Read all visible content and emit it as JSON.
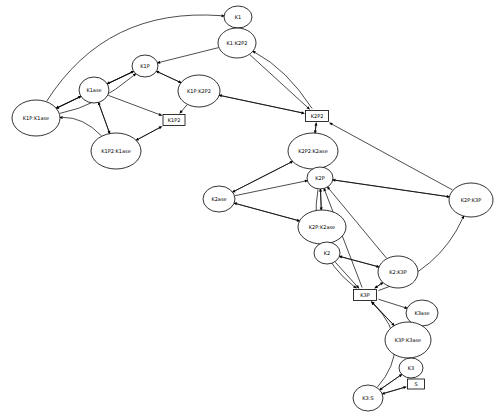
{
  "diagram": {
    "type": "directed-graph",
    "canvas": {
      "width": 500,
      "height": 420,
      "background": "#ffffff"
    },
    "style": {
      "node_fill": "#ffffff",
      "node_stroke": "#000000",
      "edge_stroke": "#000000"
    }
  },
  "nodes": [
    {
      "id": "K1",
      "label": "K1",
      "shape": "ellipse",
      "x": 238,
      "y": 17,
      "rx": 14,
      "ry": 11,
      "font": 5.0
    },
    {
      "id": "K1_K2P2",
      "label": "K1:K2P2",
      "shape": "ellipse",
      "x": 237,
      "y": 43,
      "rx": 19,
      "ry": 15,
      "font": 5.0
    },
    {
      "id": "K1P",
      "label": "K1P",
      "shape": "ellipse",
      "x": 145,
      "y": 66,
      "rx": 13,
      "ry": 11,
      "font": 5.0
    },
    {
      "id": "K1ase",
      "label": "K1ase",
      "shape": "ellipse",
      "x": 94,
      "y": 90,
      "rx": 15,
      "ry": 13,
      "font": 5.0
    },
    {
      "id": "K1P_K2P2",
      "label": "K1P:K2P2",
      "shape": "ellipse",
      "x": 199,
      "y": 91,
      "rx": 21,
      "ry": 16,
      "font": 5.0
    },
    {
      "id": "K1P_K1ase",
      "label": "K1P:K1ase",
      "shape": "ellipse",
      "x": 36,
      "y": 118,
      "rx": 24,
      "ry": 18,
      "font": 5.0
    },
    {
      "id": "K1P2",
      "label": "K1P2",
      "shape": "box",
      "x": 174,
      "y": 120,
      "w": 22,
      "h": 11,
      "font": 5.0
    },
    {
      "id": "K1P2_K1ase",
      "label": "K1P2:K1ase",
      "shape": "ellipse",
      "x": 116,
      "y": 151,
      "rx": 25,
      "ry": 18,
      "font": 5.0
    },
    {
      "id": "K2P2",
      "label": "K2P2",
      "shape": "box",
      "x": 317,
      "y": 116,
      "w": 23,
      "h": 11,
      "font": 5.0
    },
    {
      "id": "K2P2_K2ase",
      "label": "K2P2:K2ase",
      "shape": "ellipse",
      "x": 313,
      "y": 151,
      "rx": 25,
      "ry": 18,
      "font": 5.0
    },
    {
      "id": "K2P",
      "label": "K2P",
      "shape": "ellipse",
      "x": 320,
      "y": 178,
      "rx": 13,
      "ry": 11,
      "font": 5.0
    },
    {
      "id": "K2ase",
      "label": "K2ase",
      "shape": "ellipse",
      "x": 219,
      "y": 199,
      "rx": 16,
      "ry": 13,
      "font": 5.0
    },
    {
      "id": "K2P_K3P",
      "label": "K2P:K3P",
      "shape": "ellipse",
      "x": 471,
      "y": 200,
      "rx": 22,
      "ry": 17,
      "font": 5.0
    },
    {
      "id": "K2P_K2ase",
      "label": "K2P:K2ase",
      "shape": "ellipse",
      "x": 322,
      "y": 227,
      "rx": 24,
      "ry": 17,
      "font": 5.0
    },
    {
      "id": "K2",
      "label": "K2",
      "shape": "ellipse",
      "x": 327,
      "y": 253,
      "rx": 13,
      "ry": 11,
      "font": 5.0
    },
    {
      "id": "K2_K3P",
      "label": "K2:K3P",
      "shape": "ellipse",
      "x": 398,
      "y": 272,
      "rx": 20,
      "ry": 16,
      "font": 5.0
    },
    {
      "id": "K3P",
      "label": "K3P",
      "shape": "box",
      "x": 365,
      "y": 295,
      "w": 23,
      "h": 11,
      "font": 5.0
    },
    {
      "id": "K3ase",
      "label": "K3ase",
      "shape": "ellipse",
      "x": 422,
      "y": 313,
      "rx": 16,
      "ry": 13,
      "font": 5.0
    },
    {
      "id": "K3P_K3ase",
      "label": "K3P:K3ase",
      "shape": "ellipse",
      "x": 408,
      "y": 340,
      "rx": 23,
      "ry": 18,
      "font": 5.0
    },
    {
      "id": "K3",
      "label": "K3",
      "shape": "ellipse",
      "x": 411,
      "y": 368,
      "rx": 12,
      "ry": 10,
      "font": 5.0
    },
    {
      "id": "S",
      "label": "S",
      "shape": "box",
      "x": 416,
      "y": 384,
      "w": 17,
      "h": 10,
      "font": 5.0
    },
    {
      "id": "K3_S",
      "label": "K3:S",
      "shape": "ellipse",
      "x": 368,
      "y": 398,
      "rx": 15,
      "ry": 13,
      "font": 5.0
    }
  ],
  "edges": [
    {
      "from": "K1P_K1ase",
      "to": "K1",
      "curve": "arc-up-left"
    },
    {
      "from": "K1P_K1ase",
      "to": "K1P",
      "curve": "arc"
    },
    {
      "from": "K1P_K1ase",
      "to": "K1ase",
      "curve": "straight"
    },
    {
      "from": "K1ase",
      "to": "K1P_K1ase",
      "curve": "straight"
    },
    {
      "from": "K1P",
      "to": "K1P_K1ase",
      "curve": "straight"
    },
    {
      "from": "K1P",
      "to": "K1ase",
      "curve": "straight"
    },
    {
      "from": "K1ase",
      "to": "K1P",
      "curve": "straight"
    },
    {
      "from": "K1ase",
      "to": "K1P2",
      "curve": "straight"
    },
    {
      "from": "K1ase",
      "to": "K1P2_K1ase",
      "curve": "straight"
    },
    {
      "from": "K1P2_K1ase",
      "to": "K1ase",
      "curve": "straight"
    },
    {
      "from": "K1P2_K1ase",
      "to": "K1P2",
      "curve": "straight"
    },
    {
      "from": "K1P2",
      "to": "K1P2_K1ase",
      "curve": "straight"
    },
    {
      "from": "K1P2_K1ase",
      "to": "K1P_K1ase",
      "curve": "arc-low"
    },
    {
      "from": "K1P",
      "to": "K1P_K2P2",
      "curve": "straight"
    },
    {
      "from": "K1P_K2P2",
      "to": "K1P",
      "curve": "straight"
    },
    {
      "from": "K1P_K2P2",
      "to": "K1P2",
      "curve": "straight"
    },
    {
      "from": "K1P_K2P2",
      "to": "K2P2",
      "curve": "straight"
    },
    {
      "from": "K2P2",
      "to": "K1P_K2P2",
      "curve": "straight"
    },
    {
      "from": "K1_K2P2",
      "to": "K1",
      "curve": "straight"
    },
    {
      "from": "K1_K2P2",
      "to": "K1P",
      "curve": "straight"
    },
    {
      "from": "K1_K2P2",
      "to": "K2P2",
      "curve": "straight"
    },
    {
      "from": "K2P2",
      "to": "K1_K2P2",
      "curve": "arc"
    },
    {
      "from": "K1",
      "to": "K1_K2P2",
      "curve": "straight"
    },
    {
      "from": "K2P2",
      "to": "K2P2_K2ase",
      "curve": "straight"
    },
    {
      "from": "K2P2_K2ase",
      "to": "K2P2",
      "curve": "straight"
    },
    {
      "from": "K2P2_K2ase",
      "to": "K2P",
      "curve": "straight"
    },
    {
      "from": "K2P2_K2ase",
      "to": "K2ase",
      "curve": "straight"
    },
    {
      "from": "K2ase",
      "to": "K2P2_K2ase",
      "curve": "straight"
    },
    {
      "from": "K2ase",
      "to": "K2P",
      "curve": "straight"
    },
    {
      "from": "K2P",
      "to": "K2P_K2ase",
      "curve": "straight"
    },
    {
      "from": "K2P_K2ase",
      "to": "K2P",
      "curve": "straight"
    },
    {
      "from": "K2P_K2ase",
      "to": "K2",
      "curve": "straight"
    },
    {
      "from": "K2P_K2ase",
      "to": "K2ase",
      "curve": "straight"
    },
    {
      "from": "K2ase",
      "to": "K2P_K2ase",
      "curve": "straight"
    },
    {
      "from": "K2",
      "to": "K2_K3P",
      "curve": "straight"
    },
    {
      "from": "K2_K3P",
      "to": "K2",
      "curve": "straight"
    },
    {
      "from": "K2_K3P",
      "to": "K3P",
      "curve": "straight"
    },
    {
      "from": "K3P",
      "to": "K2_K3P",
      "curve": "straight"
    },
    {
      "from": "K2_K3P",
      "to": "K2P",
      "curve": "straight"
    },
    {
      "from": "K2P_K3P",
      "to": "K2P",
      "curve": "straight"
    },
    {
      "from": "K2P_K3P",
      "to": "K2P2",
      "curve": "straight"
    },
    {
      "from": "K3P",
      "to": "K2P_K3P",
      "curve": "arc-low"
    },
    {
      "from": "K2P",
      "to": "K2P_K3P",
      "curve": "straight"
    },
    {
      "from": "K2",
      "to": "K3P",
      "curve": "straight"
    },
    {
      "from": "K2P",
      "to": "K3P",
      "curve": "arc-left"
    },
    {
      "from": "K3P",
      "to": "K2P",
      "curve": "straight"
    },
    {
      "from": "K3P",
      "to": "K3ase",
      "curve": "straight"
    },
    {
      "from": "K3P",
      "to": "K3P_K3ase",
      "curve": "straight"
    },
    {
      "from": "K3P_K3ase",
      "to": "K3P",
      "curve": "straight"
    },
    {
      "from": "K3P_K3ase",
      "to": "K3ase",
      "curve": "straight"
    },
    {
      "from": "K3ase",
      "to": "K3P_K3ase",
      "curve": "straight"
    },
    {
      "from": "K3P_K3ase",
      "to": "K3",
      "curve": "straight"
    },
    {
      "from": "K3",
      "to": "K3P_K3ase",
      "curve": "straight"
    },
    {
      "from": "K3",
      "to": "S",
      "curve": "straight"
    },
    {
      "from": "K3_S",
      "to": "S",
      "curve": "straight"
    },
    {
      "from": "S",
      "to": "K3_S",
      "curve": "straight"
    },
    {
      "from": "K3",
      "to": "K3_S",
      "curve": "straight"
    },
    {
      "from": "K3_S",
      "to": "K3",
      "curve": "straight"
    },
    {
      "from": "K3_S",
      "to": "K3P",
      "curve": "arc-left-big"
    }
  ]
}
